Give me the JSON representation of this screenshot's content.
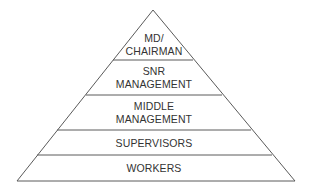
{
  "diagram": {
    "type": "pyramid",
    "colors": {
      "line": "#5a5a5a",
      "text": "#333333",
      "background": "#ffffff"
    },
    "tiers": [
      {
        "label_lines": [
          "MD/",
          "CHAIRMAN"
        ]
      },
      {
        "label_lines": [
          "SNR",
          "MANAGEMENT"
        ]
      },
      {
        "label_lines": [
          "MIDDLE",
          "MANAGEMENT"
        ]
      },
      {
        "label_lines": [
          "SUPERVISORS"
        ]
      },
      {
        "label_lines": [
          "WORKERS"
        ]
      }
    ]
  }
}
